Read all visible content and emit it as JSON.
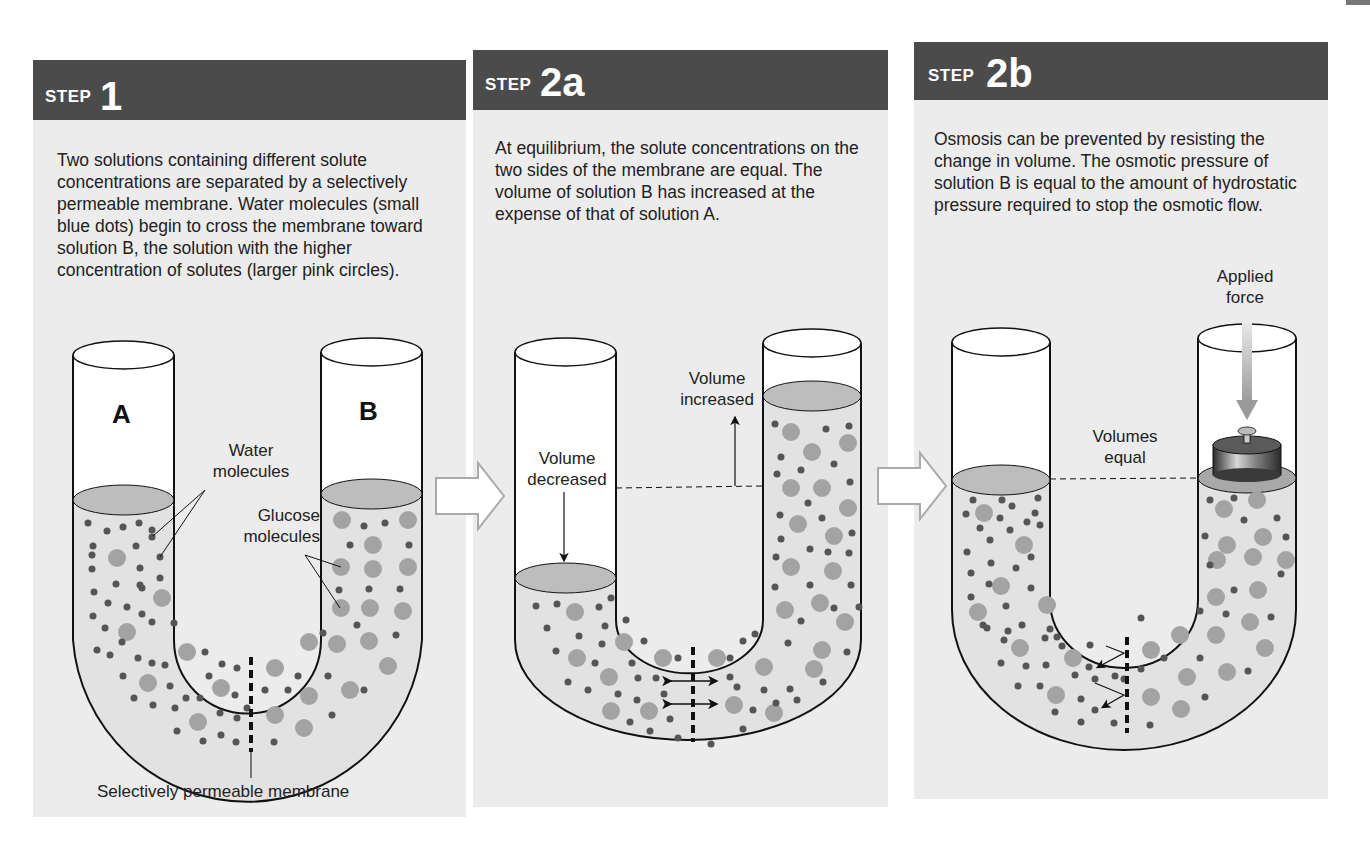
{
  "steps": [
    {
      "id": "step-1",
      "step_word": "STEP",
      "step_number": "1",
      "description": "Two solutions containing different solute concentrations are separated by a selectively permeable membrane. Water molecules (small blue dots) begin to cross the membrane toward solution B, the solution with the higher concentration of solutes (larger pink circles).",
      "labels": {
        "tube_a": "A",
        "tube_b": "B",
        "water_molecules": "Water\nmolecules",
        "glucose_molecules": "Glucose\nmolecules",
        "membrane": "Selectively permeable membrane"
      }
    },
    {
      "id": "step-2a",
      "step_word": "STEP",
      "step_number": "2a",
      "description": "At equilibrium, the solute concentrations on the two sides of the membrane are equal. The volume of solution B has increased at the expense of that of solution A.",
      "labels": {
        "volume_decreased": "Volume\ndecreased",
        "volume_increased": "Volume\nincreased"
      }
    },
    {
      "id": "step-2b",
      "step_word": "STEP",
      "step_number": "2b",
      "description": "Osmosis can be prevented by resisting the change in volume. The osmotic pressure of solution B is equal to the amount of hydrostatic pressure required to stop the osmotic flow.",
      "labels": {
        "applied_force": "Applied\nforce",
        "volumes_equal": "Volumes\nequal"
      }
    }
  ],
  "colors": {
    "header_bg": "#4b4b4b",
    "panel_bg": "#ececec",
    "solution_fill": "#e2e2e2",
    "surface_fill": "#bdbdbd",
    "solute_circle": "#a3a3a3",
    "water_dot": "#555555",
    "outline": "#111111"
  }
}
